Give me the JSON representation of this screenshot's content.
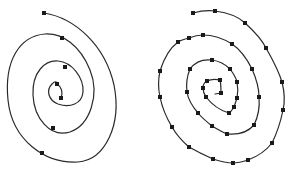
{
  "figure": {
    "panels": [
      {
        "id": "left",
        "label": "sparse-spiral",
        "marker_size": 4,
        "path": "M44,13 C75,18 105,45 114,85 C122,125 105,160 78,162 C45,164 12,140 8,100 C4,60 20,36 45,34 C62,33 80,45 90,70 C100,95 90,125 70,132 C50,138 34,118 33,95 C32,72 45,60 58,61 C72,62 84,78 83,92 C82,104 70,108 58,104 C48,100 46,90 52,84 C55,81 57,81 57,84 M57,84 C62,87 63,93 61,98",
        "points": [
          [
            44,
            13
          ],
          [
            62,
            38
          ],
          [
            65,
            67
          ],
          [
            57,
            84
          ],
          [
            61,
            98
          ],
          [
            53,
            128
          ],
          [
            42,
            153
          ]
        ]
      },
      {
        "id": "right",
        "label": "dense-spiral",
        "marker_size": 4,
        "path": "M193,13 C200,11 208,10 215,11 C230,13 240,18 245,23 C255,32 262,40 266,48 C274,62 279,72 282,82 C285,94 285,102 283,110 C280,125 276,135 272,143 C265,152 256,157 248,160 C242,162 238,163 233,163 C226,163 219,161 213,159 C204,155 196,151 189,147 C182,141 176,134 172,127 C166,117 162,107 160,97 C158,88 158,80 160,71 C164,58 170,48 178,42 C181,40 185,39 189,38 C194,36 198,35 203,35 C214,35 224,39 232,44 C241,50 247,59 252,69 C256,78 259,88 259,97 C260,108 258,117 254,125 C248,132 238,135 227,134 C222,132 217,129 212,126 C207,122 202,118 198,113 C192,106 188,99 187,92 C186,84 187,76 190,69 C195,62 203,59 212,60 C219,61 225,64 230,69 C233,73 236,77 237,82 C238,87 238,93 237,98 C236,101 235,104 234,107 C232,110 231,112 229,113 C222,111 213,106 206,97 C204,94 203,91 203,88 C203,85 205,82 207,81 C211,79 216,79 220,80 C221,84 221,89 221,93 L215,94",
        "points": [
          [
            193,
            13
          ],
          [
            215,
            11
          ],
          [
            245,
            23
          ],
          [
            266,
            48
          ],
          [
            282,
            82
          ],
          [
            283,
            110
          ],
          [
            272,
            143
          ],
          [
            248,
            160
          ],
          [
            233,
            163
          ],
          [
            213,
            159
          ],
          [
            189,
            147
          ],
          [
            172,
            127
          ],
          [
            160,
            97
          ],
          [
            160,
            71
          ],
          [
            178,
            42
          ],
          [
            189,
            38
          ],
          [
            203,
            35
          ],
          [
            232,
            44
          ],
          [
            252,
            69
          ],
          [
            259,
            97
          ],
          [
            254,
            125
          ],
          [
            227,
            134
          ],
          [
            212,
            126
          ],
          [
            198,
            113
          ],
          [
            187,
            92
          ],
          [
            190,
            69
          ],
          [
            212,
            60
          ],
          [
            230,
            69
          ],
          [
            237,
            82
          ],
          [
            237,
            98
          ],
          [
            234,
            107
          ],
          [
            229,
            113
          ],
          [
            206,
            97
          ],
          [
            203,
            88
          ],
          [
            207,
            81
          ],
          [
            220,
            80
          ],
          [
            221,
            93
          ]
        ]
      }
    ],
    "colors": {
      "stroke": "#2a2a2a",
      "marker": "#1a1a1a",
      "background": "#ffffff"
    }
  }
}
